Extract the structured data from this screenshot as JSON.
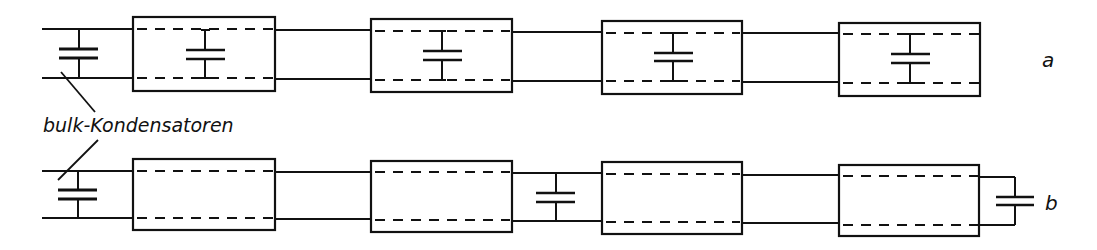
{
  "diagram": {
    "labels": {
      "bulk": "bulk-Kondensatoren",
      "row_a": "a",
      "row_b": "b"
    },
    "rows": [
      {
        "id": "a",
        "description": "Bulk capacitor at input; decoupling capacitor inside each of 4 modules",
        "bulk_capacitor": true,
        "modules": [
          {
            "index": 1,
            "internal_capacitor": true
          },
          {
            "index": 2,
            "internal_capacitor": true
          },
          {
            "index": 3,
            "internal_capacitor": true
          },
          {
            "index": 4,
            "internal_capacitor": true
          }
        ],
        "external_capacitors": []
      },
      {
        "id": "b",
        "description": "Bulk capacitor at input; modules without internal capacitors; external capacitors between module 2/3 and after module 4",
        "bulk_capacitor": true,
        "modules": [
          {
            "index": 1,
            "internal_capacitor": false
          },
          {
            "index": 2,
            "internal_capacitor": false
          },
          {
            "index": 3,
            "internal_capacitor": false
          },
          {
            "index": 4,
            "internal_capacitor": false
          }
        ],
        "external_capacitors": [
          "between module 2 and 3",
          "after module 4 (end)"
        ]
      }
    ],
    "colors": {
      "ink": "#111111",
      "background": "#ffffff"
    }
  }
}
